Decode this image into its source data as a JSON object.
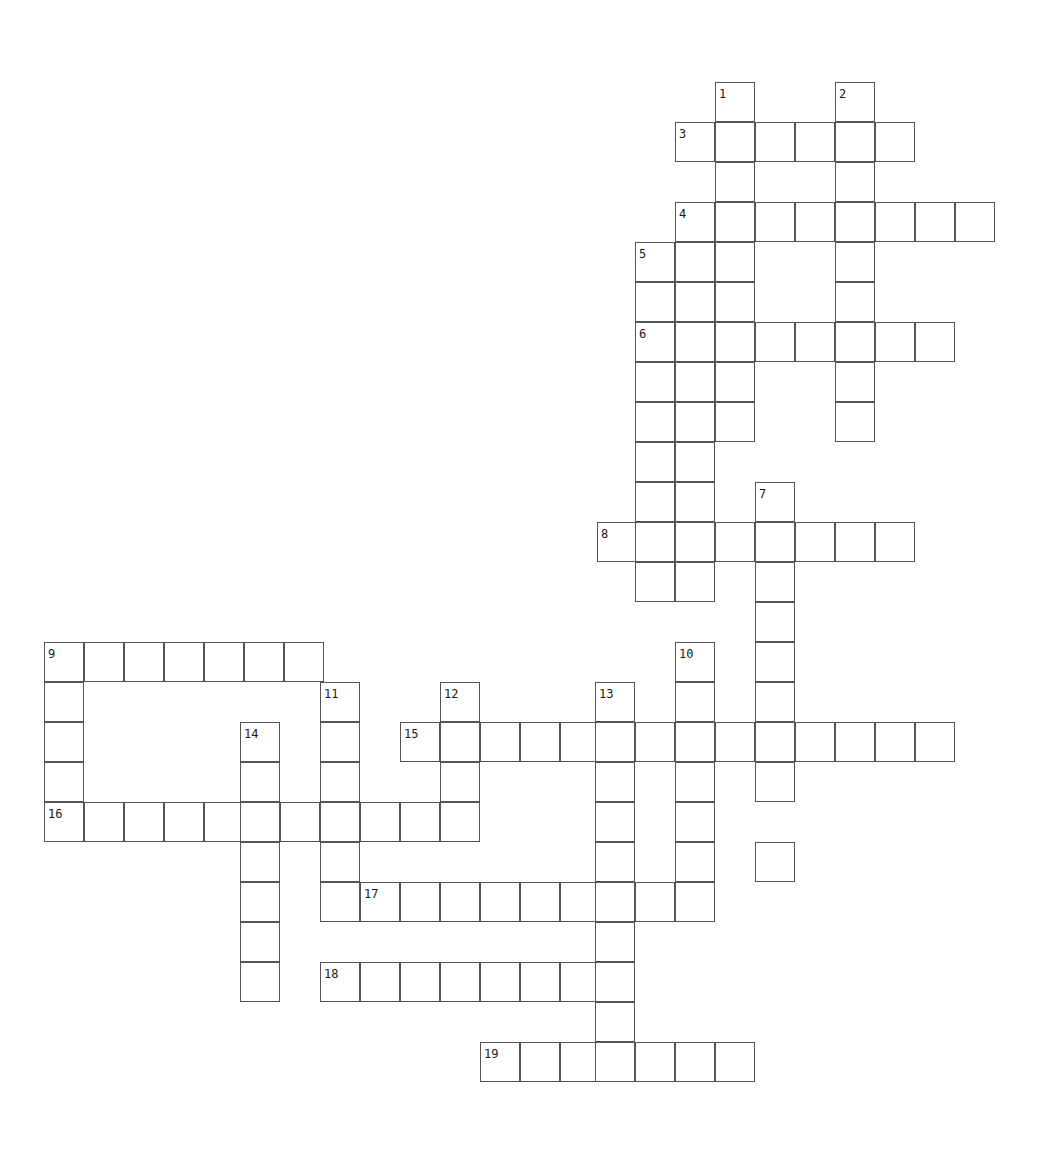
{
  "page": {
    "width": 1057,
    "height": 1168,
    "background_color": "#ffffff",
    "cell_size": 40,
    "cell_border_color": "#555555",
    "cell_fill_color": "#ffffff",
    "number_color": "#1a1a1a",
    "number_font_size": 12
  },
  "grid": {
    "origin_x": 44,
    "origin_y": 82,
    "columns": 25,
    "rows": 28,
    "note": "Blank (unfilled) crossword grid; no answer letters are printed in the cells."
  },
  "entries": [
    {
      "number": "1",
      "direction": "down",
      "col": 16,
      "row": 0,
      "length": 9,
      "x": 684,
      "y": 82
    },
    {
      "number": "2",
      "direction": "down",
      "col": 19,
      "row": 0,
      "length": 9,
      "x": 804,
      "y": 82
    },
    {
      "number": "3",
      "direction": "across",
      "col": 15,
      "row": 1,
      "length": 6,
      "x": 644,
      "y": 122
    },
    {
      "number": "4",
      "direction": "across",
      "col": 15,
      "row": 3,
      "length": 8,
      "x": 644,
      "y": 202
    },
    {
      "number": "5",
      "direction": "down",
      "col": 14,
      "row": 4,
      "length": 9,
      "x": 604,
      "y": 242
    },
    {
      "number": "6",
      "direction": "across",
      "col": 14,
      "row": 6,
      "length": 8,
      "x": 604,
      "y": 322
    },
    {
      "number": "7",
      "direction": "down",
      "col": 17,
      "row": 10,
      "length": 9,
      "x": 724,
      "y": 482
    },
    {
      "number": "8",
      "direction": "across",
      "col": 13,
      "row": 11,
      "length": 8,
      "x": 564,
      "y": 522
    },
    {
      "number": "9",
      "direction": "down",
      "col": 0,
      "row": 14,
      "length": 5,
      "x": 44,
      "y": 642
    },
    {
      "number": "9",
      "direction": "across",
      "col": 0,
      "row": 14,
      "length": 7,
      "x": 44,
      "y": 642
    },
    {
      "number": "10",
      "direction": "down",
      "col": 15,
      "row": 14,
      "length": 7,
      "x": 644,
      "y": 642
    },
    {
      "number": "11",
      "direction": "down",
      "col": 7,
      "row": 15,
      "length": 5,
      "x": 324,
      "y": 682
    },
    {
      "number": "12",
      "direction": "down",
      "col": 10,
      "row": 15,
      "length": 4,
      "x": 444,
      "y": 682
    },
    {
      "number": "13",
      "direction": "down",
      "col": 14,
      "row": 15,
      "length": 11,
      "x": 604,
      "y": 682
    },
    {
      "number": "14",
      "direction": "down",
      "col": 5,
      "row": 16,
      "length": 7,
      "x": 244,
      "y": 722
    },
    {
      "number": "15",
      "direction": "across",
      "col": 9,
      "row": 16,
      "length": 14,
      "x": 404,
      "y": 722
    },
    {
      "number": "16",
      "direction": "across",
      "col": 0,
      "row": 18,
      "length": 11,
      "x": 44,
      "y": 802
    },
    {
      "number": "17",
      "direction": "across",
      "col": 8,
      "row": 20,
      "length": 9,
      "x": 364,
      "y": 882
    },
    {
      "number": "18",
      "direction": "across",
      "col": 7,
      "row": 22,
      "length": 8,
      "x": 324,
      "y": 962
    },
    {
      "number": "19",
      "direction": "across",
      "col": 11,
      "row": 24,
      "length": 7,
      "x": 484,
      "y": 1042
    }
  ],
  "cells": [
    {
      "x": 715,
      "y": 82
    },
    {
      "x": 835,
      "y": 82
    },
    {
      "x": 675,
      "y": 122
    },
    {
      "x": 715,
      "y": 122
    },
    {
      "x": 755,
      "y": 122
    },
    {
      "x": 795,
      "y": 122
    },
    {
      "x": 835,
      "y": 122
    },
    {
      "x": 875,
      "y": 122
    },
    {
      "x": 715,
      "y": 162
    },
    {
      "x": 835,
      "y": 162
    },
    {
      "x": 675,
      "y": 202
    },
    {
      "x": 715,
      "y": 202
    },
    {
      "x": 755,
      "y": 202
    },
    {
      "x": 795,
      "y": 202
    },
    {
      "x": 835,
      "y": 202
    },
    {
      "x": 875,
      "y": 202
    },
    {
      "x": 915,
      "y": 202
    },
    {
      "x": 955,
      "y": 202
    },
    {
      "x": 635,
      "y": 242
    },
    {
      "x": 675,
      "y": 242
    },
    {
      "x": 715,
      "y": 242
    },
    {
      "x": 835,
      "y": 242
    },
    {
      "x": 635,
      "y": 282
    },
    {
      "x": 675,
      "y": 282
    },
    {
      "x": 715,
      "y": 282
    },
    {
      "x": 835,
      "y": 282
    },
    {
      "x": 635,
      "y": 322
    },
    {
      "x": 675,
      "y": 322
    },
    {
      "x": 715,
      "y": 322
    },
    {
      "x": 755,
      "y": 322
    },
    {
      "x": 795,
      "y": 322
    },
    {
      "x": 835,
      "y": 322
    },
    {
      "x": 875,
      "y": 322
    },
    {
      "x": 915,
      "y": 322
    },
    {
      "x": 635,
      "y": 362
    },
    {
      "x": 675,
      "y": 362
    },
    {
      "x": 715,
      "y": 362
    },
    {
      "x": 835,
      "y": 362
    },
    {
      "x": 635,
      "y": 402
    },
    {
      "x": 675,
      "y": 402
    },
    {
      "x": 715,
      "y": 402
    },
    {
      "x": 835,
      "y": 402
    },
    {
      "x": 635,
      "y": 442
    },
    {
      "x": 675,
      "y": 442
    },
    {
      "x": 635,
      "y": 482
    },
    {
      "x": 675,
      "y": 482
    },
    {
      "x": 755,
      "y": 482
    },
    {
      "x": 597,
      "y": 522
    },
    {
      "x": 635,
      "y": 522
    },
    {
      "x": 675,
      "y": 522
    },
    {
      "x": 715,
      "y": 522
    },
    {
      "x": 755,
      "y": 522
    },
    {
      "x": 795,
      "y": 522
    },
    {
      "x": 835,
      "y": 522
    },
    {
      "x": 875,
      "y": 522
    },
    {
      "x": 635,
      "y": 562
    },
    {
      "x": 675,
      "y": 562
    },
    {
      "x": 755,
      "y": 562
    },
    {
      "x": 755,
      "y": 602
    },
    {
      "x": 44,
      "y": 642
    },
    {
      "x": 84,
      "y": 642
    },
    {
      "x": 124,
      "y": 642
    },
    {
      "x": 164,
      "y": 642
    },
    {
      "x": 204,
      "y": 642
    },
    {
      "x": 244,
      "y": 642
    },
    {
      "x": 284,
      "y": 642
    },
    {
      "x": 675,
      "y": 642
    },
    {
      "x": 755,
      "y": 642
    },
    {
      "x": 44,
      "y": 682
    },
    {
      "x": 320,
      "y": 682
    },
    {
      "x": 440,
      "y": 682
    },
    {
      "x": 595,
      "y": 682
    },
    {
      "x": 675,
      "y": 682
    },
    {
      "x": 755,
      "y": 682
    },
    {
      "x": 44,
      "y": 722
    },
    {
      "x": 240,
      "y": 722
    },
    {
      "x": 320,
      "y": 722
    },
    {
      "x": 400,
      "y": 722
    },
    {
      "x": 440,
      "y": 722
    },
    {
      "x": 480,
      "y": 722
    },
    {
      "x": 520,
      "y": 722
    },
    {
      "x": 560,
      "y": 722
    },
    {
      "x": 595,
      "y": 722
    },
    {
      "x": 635,
      "y": 722
    },
    {
      "x": 675,
      "y": 722
    },
    {
      "x": 715,
      "y": 722
    },
    {
      "x": 755,
      "y": 722
    },
    {
      "x": 795,
      "y": 722
    },
    {
      "x": 835,
      "y": 722
    },
    {
      "x": 875,
      "y": 722
    },
    {
      "x": 915,
      "y": 722
    },
    {
      "x": 44,
      "y": 762
    },
    {
      "x": 240,
      "y": 762
    },
    {
      "x": 320,
      "y": 762
    },
    {
      "x": 440,
      "y": 762
    },
    {
      "x": 595,
      "y": 762
    },
    {
      "x": 675,
      "y": 762
    },
    {
      "x": 755,
      "y": 762
    },
    {
      "x": 44,
      "y": 802
    },
    {
      "x": 84,
      "y": 802
    },
    {
      "x": 124,
      "y": 802
    },
    {
      "x": 164,
      "y": 802
    },
    {
      "x": 204,
      "y": 802
    },
    {
      "x": 240,
      "y": 802
    },
    {
      "x": 280,
      "y": 802
    },
    {
      "x": 320,
      "y": 802
    },
    {
      "x": 360,
      "y": 802
    },
    {
      "x": 400,
      "y": 802
    },
    {
      "x": 440,
      "y": 802
    },
    {
      "x": 595,
      "y": 802
    },
    {
      "x": 675,
      "y": 802
    },
    {
      "x": 240,
      "y": 842
    },
    {
      "x": 320,
      "y": 842
    },
    {
      "x": 595,
      "y": 842
    },
    {
      "x": 675,
      "y": 842
    },
    {
      "x": 755,
      "y": 842
    },
    {
      "x": 240,
      "y": 882
    },
    {
      "x": 320,
      "y": 882
    },
    {
      "x": 360,
      "y": 882
    },
    {
      "x": 400,
      "y": 882
    },
    {
      "x": 440,
      "y": 882
    },
    {
      "x": 480,
      "y": 882
    },
    {
      "x": 520,
      "y": 882
    },
    {
      "x": 560,
      "y": 882
    },
    {
      "x": 595,
      "y": 882
    },
    {
      "x": 635,
      "y": 882
    },
    {
      "x": 675,
      "y": 882
    },
    {
      "x": 240,
      "y": 922
    },
    {
      "x": 595,
      "y": 922
    },
    {
      "x": 240,
      "y": 962
    },
    {
      "x": 320,
      "y": 962
    },
    {
      "x": 360,
      "y": 962
    },
    {
      "x": 400,
      "y": 962
    },
    {
      "x": 440,
      "y": 962
    },
    {
      "x": 480,
      "y": 962
    },
    {
      "x": 520,
      "y": 962
    },
    {
      "x": 560,
      "y": 962
    },
    {
      "x": 595,
      "y": 962
    },
    {
      "x": 595,
      "y": 1002
    },
    {
      "x": 480,
      "y": 1042
    },
    {
      "x": 520,
      "y": 1042
    },
    {
      "x": 560,
      "y": 1042
    },
    {
      "x": 595,
      "y": 1042
    },
    {
      "x": 635,
      "y": 1042
    },
    {
      "x": 675,
      "y": 1042
    },
    {
      "x": 715,
      "y": 1042
    }
  ],
  "numbered_labels": [
    {
      "text": "1",
      "x": 719,
      "y": 88
    },
    {
      "text": "2",
      "x": 839,
      "y": 88
    },
    {
      "text": "3",
      "x": 679,
      "y": 128
    },
    {
      "text": "4",
      "x": 679,
      "y": 208
    },
    {
      "text": "5",
      "x": 639,
      "y": 248
    },
    {
      "text": "6",
      "x": 639,
      "y": 328
    },
    {
      "text": "7",
      "x": 759,
      "y": 488
    },
    {
      "text": "8",
      "x": 601,
      "y": 528
    },
    {
      "text": "9",
      "x": 48,
      "y": 648
    },
    {
      "text": "10",
      "x": 679,
      "y": 648
    },
    {
      "text": "11",
      "x": 324,
      "y": 688
    },
    {
      "text": "12",
      "x": 444,
      "y": 688
    },
    {
      "text": "13",
      "x": 599,
      "y": 688
    },
    {
      "text": "14",
      "x": 244,
      "y": 728
    },
    {
      "text": "15",
      "x": 404,
      "y": 728
    },
    {
      "text": "16",
      "x": 48,
      "y": 808
    },
    {
      "text": "17",
      "x": 364,
      "y": 888
    },
    {
      "text": "18",
      "x": 324,
      "y": 968
    },
    {
      "text": "19",
      "x": 484,
      "y": 1048
    }
  ]
}
